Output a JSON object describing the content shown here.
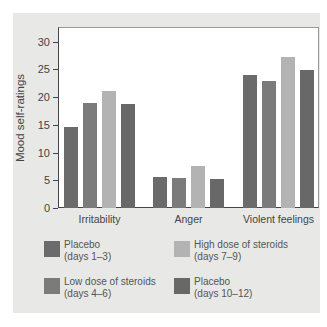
{
  "chart_data": {
    "type": "bar",
    "title": "",
    "xlabel": "",
    "ylabel": "Mood self-ratings",
    "ylim": [
      0,
      32
    ],
    "yticks": [
      0,
      5,
      10,
      15,
      20,
      25,
      30
    ],
    "grid": true,
    "legend_position": "bottom",
    "categories": [
      "Irritability",
      "Anger",
      "Violent feelings"
    ],
    "series": [
      {
        "name": "Placebo (days 1–3)",
        "color": "#6b6b6b",
        "values": [
          14.6,
          5.5,
          23.9
        ]
      },
      {
        "name": "Low dose of steroids (days 4–6)",
        "color": "#7b7b7b",
        "values": [
          19.0,
          5.4,
          22.9
        ]
      },
      {
        "name": "High dose of steroids (days 7–9)",
        "color": "#b3b3b3",
        "values": [
          21.0,
          7.6,
          27.2
        ]
      },
      {
        "name": "Placebo (days 10–12)",
        "color": "#686868",
        "values": [
          18.7,
          5.3,
          24.8
        ]
      }
    ]
  },
  "legend": [
    {
      "line1": "Placebo",
      "line2": "(days 1–3)",
      "color": "#6b6b6b"
    },
    {
      "line1": "Low dose of steroids",
      "line2": "(days 4–6)",
      "color": "#7b7b7b"
    },
    {
      "line1": "High dose of steroids",
      "line2": "(days 7–9)",
      "color": "#b3b3b3"
    },
    {
      "line1": "Placebo",
      "line2": "(days 10–12)",
      "color": "#686868"
    }
  ]
}
